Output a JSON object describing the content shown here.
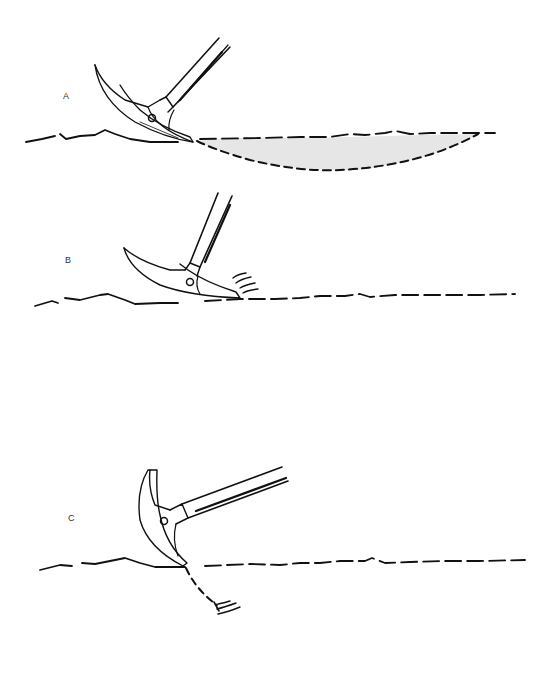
{
  "figure": {
    "panels": [
      {
        "id": "A",
        "label": "A",
        "description": "Pick strikes shallowly; surface crust fractures into a large shaded lens"
      },
      {
        "id": "B",
        "label": "B",
        "description": "Pick glances off hard surface with vibration marks"
      },
      {
        "id": "C",
        "label": "C",
        "description": "Pick penetrates; dashed fracture line goes down with vibration marks"
      }
    ]
  },
  "colors": {
    "ink": "#111111",
    "shade": "#e4e4e4",
    "background": "#ffffff"
  }
}
